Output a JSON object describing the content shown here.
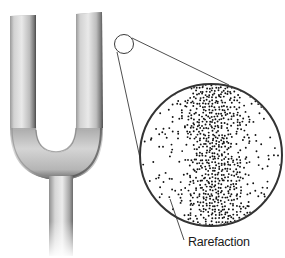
{
  "figure": {
    "magnifier": {
      "description": "magnified view of air particles near the tuning fork prong",
      "band": "compression region (dense particles)",
      "sides": "rarefaction region (sparse particles)"
    },
    "labels": [
      {
        "text": "Rarefaction"
      }
    ]
  },
  "colors": {
    "background": "#ffffff",
    "fork_light": "#e6e6e6",
    "fork_mid": "#b8b8b8",
    "fork_dark": "#555555",
    "line": "#3a3a3a",
    "dot": "#111111"
  }
}
